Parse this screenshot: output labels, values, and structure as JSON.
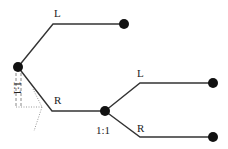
{
  "diagram": {
    "type": "game-tree",
    "colors": {
      "edge": "#333333",
      "node": "#111111",
      "guide": "#888888",
      "background": "#ffffff"
    },
    "nodes": [
      {
        "id": "root",
        "x": 18,
        "y": 67,
        "label": "1:1"
      },
      {
        "id": "root_L_leaf",
        "x": 124,
        "y": 24
      },
      {
        "id": "mid",
        "x": 105,
        "y": 111,
        "label": "1:1"
      },
      {
        "id": "mid_L_leaf",
        "x": 213,
        "y": 83
      },
      {
        "id": "mid_R_leaf",
        "x": 213,
        "y": 137
      }
    ],
    "edges": [
      {
        "from": "root",
        "to": "root_L_leaf",
        "label": "L"
      },
      {
        "from": "root",
        "to": "mid",
        "label": "R"
      },
      {
        "from": "mid",
        "to": "mid_L_leaf",
        "label": "L"
      },
      {
        "from": "mid",
        "to": "mid_R_leaf",
        "label": "R"
      }
    ],
    "labels": {
      "root_L": "L",
      "root_R": "R",
      "root_info": "1:1",
      "mid_L": "L",
      "mid_R": "R",
      "mid_info": "1:1"
    }
  }
}
